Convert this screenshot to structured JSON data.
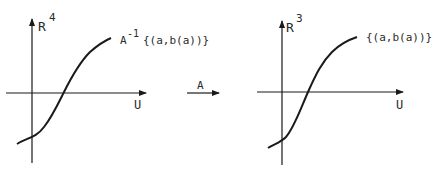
{
  "left_diagram": {
    "axis_vertical_label": "R",
    "axis_vertical_exponent": "4",
    "axis_horizontal_label": "U",
    "curve_label_prefix": "A",
    "curve_label_exponent": "-1",
    "curve_label_set": "{(a,b(a))}"
  },
  "mapping_arrow": {
    "label": "A"
  },
  "right_diagram": {
    "axis_vertical_label": "R",
    "axis_vertical_exponent": "3",
    "axis_horizontal_label": "U",
    "curve_label_set": "{(a,b(a))}"
  },
  "colors": {
    "stroke": "#1a1a1a",
    "background": "#ffffff"
  }
}
